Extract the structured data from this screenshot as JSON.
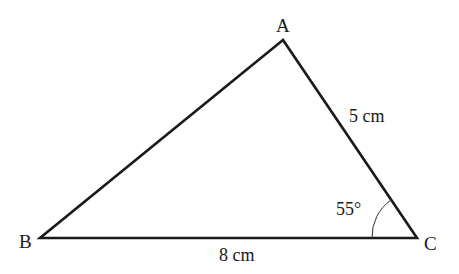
{
  "diagram": {
    "type": "triangle",
    "vertices": {
      "A": {
        "label": "A"
      },
      "B": {
        "label": "B"
      },
      "C": {
        "label": "C"
      }
    },
    "sides": {
      "AC": {
        "label": "5 cm"
      },
      "BC": {
        "label": "8 cm"
      }
    },
    "angles": {
      "C": {
        "label": "55°"
      }
    },
    "colors": {
      "line": "#1a1a1a",
      "background": "#ffffff"
    }
  }
}
